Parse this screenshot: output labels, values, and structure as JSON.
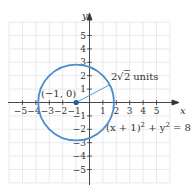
{
  "figure": {
    "type": "circle-graph",
    "equation": "(x + 1)² + y² = 8",
    "equation_parts": {
      "lhs_a": "(x + 1)",
      "exp_a": "2",
      "plus": " + y",
      "exp_b": "2",
      "rhs": " = 8"
    },
    "center_label": "(−1, 0)",
    "radius_label_prefix": "2",
    "radius_label_sqrt": "2",
    "radius_label_suffix": " units",
    "center": [
      -1,
      0
    ],
    "radius": 2.8284,
    "x_axis_label": "x",
    "y_axis_label": "y",
    "x_ticks": [
      "−5",
      "−4",
      "−3",
      "−2",
      "−1",
      "1",
      "2",
      "3",
      "4",
      "5"
    ],
    "y_ticks": [
      "5",
      "4",
      "3",
      "2",
      "1",
      "−1",
      "−2",
      "−3",
      "−4",
      "−5"
    ],
    "colors": {
      "circle": "#4a8ccc",
      "center_dot": "#1f5fa3",
      "grid": "#e6e6ea",
      "axes": "#333333"
    }
  }
}
